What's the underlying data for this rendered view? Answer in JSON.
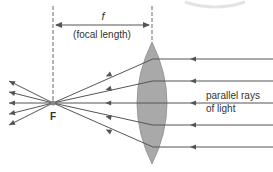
{
  "diagram": {
    "focal_symbol": "f",
    "focal_caption": "(focal length)",
    "focal_point_label": "F",
    "incoming_label_line1": "parallel rays",
    "incoming_label_line2": "of light",
    "ray_count": 5,
    "colors": {
      "ray": "#555555",
      "lens_fill": "#a9a9a9",
      "lens_stroke": "#8a8a8a",
      "text": "#333333",
      "guide": "#666666"
    }
  }
}
